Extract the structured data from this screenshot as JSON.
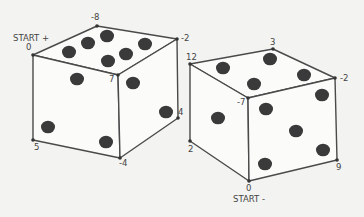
{
  "diagram": {
    "type": "two-dice-vertex-labels",
    "dice": [
      {
        "id": "left",
        "start_label": "START +",
        "vertices": [
          {
            "name": "v0",
            "label": "0",
            "x": 33,
            "y": 55,
            "lx": 26,
            "ly": 50
          },
          {
            "name": "v-8",
            "label": "-8",
            "x": 97,
            "y": 26,
            "lx": 91,
            "ly": 20
          },
          {
            "name": "v-2",
            "label": "-2",
            "x": 177,
            "y": 39,
            "lx": 181,
            "ly": 41
          },
          {
            "name": "v7",
            "label": "7",
            "x": 118,
            "y": 75,
            "lx": 109,
            "ly": 82
          },
          {
            "name": "v5",
            "label": "5",
            "x": 33,
            "y": 140,
            "lx": 34,
            "ly": 150
          },
          {
            "name": "v-4",
            "label": "-4",
            "x": 120,
            "y": 158,
            "lx": 119,
            "ly": 166
          },
          {
            "name": "v4",
            "label": "4",
            "x": 178,
            "y": 118,
            "lx": 178,
            "ly": 115
          }
        ],
        "start_label_pos": {
          "x": 13,
          "y": 41
        },
        "faces": {
          "top": {
            "pips": 6,
            "points": [
              [
                33,
                55
              ],
              [
                97,
                26
              ],
              [
                177,
                39
              ],
              [
                118,
                75
              ]
            ]
          },
          "left": {
            "pips": 2,
            "points": [
              [
                33,
                55
              ],
              [
                118,
                75
              ],
              [
                120,
                158
              ],
              [
                33,
                140
              ]
            ]
          },
          "right": {
            "pips": 3,
            "points": [
              [
                118,
                75
              ],
              [
                177,
                39
              ],
              [
                178,
                118
              ],
              [
                120,
                158
              ]
            ]
          }
        },
        "pips": [
          [
            69,
            52
          ],
          [
            88,
            43
          ],
          [
            107,
            36
          ],
          [
            108,
            61
          ],
          [
            126,
            54
          ],
          [
            145,
            44
          ],
          [
            77,
            79
          ],
          [
            48,
            127
          ],
          [
            133,
            83
          ],
          [
            166,
            112
          ],
          [
            106,
            142
          ]
        ]
      },
      {
        "id": "right",
        "start_label": "START -",
        "vertices": [
          {
            "name": "v12",
            "label": "12",
            "x": 190,
            "y": 64,
            "lx": 186,
            "ly": 60
          },
          {
            "name": "v3",
            "label": "3",
            "x": 273,
            "y": 49,
            "lx": 270,
            "ly": 45
          },
          {
            "name": "v-2",
            "label": "-2",
            "x": 335,
            "y": 78,
            "lx": 340,
            "ly": 81
          },
          {
            "name": "v-7",
            "label": "-7",
            "x": 248,
            "y": 98,
            "lx": 237,
            "ly": 105
          },
          {
            "name": "v2",
            "label": "2",
            "x": 190,
            "y": 141,
            "lx": 188,
            "ly": 152
          },
          {
            "name": "v0",
            "label": "0",
            "x": 249,
            "y": 181,
            "lx": 246,
            "ly": 191
          },
          {
            "name": "v9",
            "label": "9",
            "x": 337,
            "y": 160,
            "lx": 336,
            "ly": 170
          }
        ],
        "start_label_pos": {
          "x": 233,
          "y": 202
        },
        "faces": {
          "top": {
            "pips": 4,
            "points": [
              [
                190,
                64
              ],
              [
                273,
                49
              ],
              [
                335,
                78
              ],
              [
                248,
                98
              ]
            ]
          },
          "left": {
            "pips": 1,
            "points": [
              [
                190,
                64
              ],
              [
                248,
                98
              ],
              [
                249,
                181
              ],
              [
                190,
                141
              ]
            ]
          },
          "right": {
            "pips": 5,
            "points": [
              [
                248,
                98
              ],
              [
                335,
                78
              ],
              [
                337,
                160
              ],
              [
                249,
                181
              ]
            ]
          }
        },
        "pips": [
          [
            223,
            68
          ],
          [
            270,
            59
          ],
          [
            304,
            75
          ],
          [
            254,
            84
          ],
          [
            218,
            118
          ],
          [
            266,
            109
          ],
          [
            322,
            95
          ],
          [
            296,
            131
          ],
          [
            265,
            164
          ],
          [
            323,
            150
          ]
        ]
      }
    ]
  }
}
